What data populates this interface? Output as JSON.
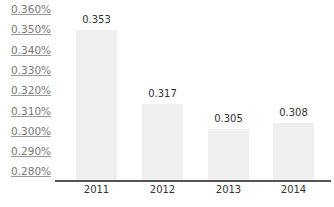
{
  "chart_data": {
    "type": "bar",
    "title": "",
    "xlabel": "",
    "ylabel": "",
    "categories": [
      "2011",
      "2012",
      "2013",
      "2014"
    ],
    "values": [
      0.353,
      0.317,
      0.305,
      0.308
    ],
    "value_labels": [
      "0.353",
      "0.317",
      "0.305",
      "0.308"
    ],
    "y_ticks": [
      "0.360%",
      "0.350%",
      "0.340%",
      "0.330%",
      "0.320%",
      "0.310%",
      "0.300%",
      "0.290%",
      "0.280%"
    ],
    "ylim": [
      0.28,
      0.36
    ],
    "grid": false,
    "bar_color": "#efefef",
    "axis_color": "#555555"
  }
}
